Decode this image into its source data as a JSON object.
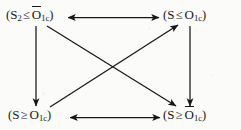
{
  "diagram": {
    "type": "commutative-square-diagram",
    "background_color": "#fbfbfa",
    "line_color": "#171717",
    "nodes": [
      {
        "id": "top-left",
        "position": "top-left",
        "text": "(S2 ≤ Ŏ1c)",
        "open_paren": "(",
        "variable": "S",
        "variable_subscript": "2",
        "relation": "≤",
        "operand": "O",
        "operand_overbar": true,
        "operand_subscript": "1c",
        "close_paren": ")"
      },
      {
        "id": "top-right",
        "position": "top-right",
        "text": "(S ≤ O1c)",
        "open_paren": "(",
        "variable": "S",
        "variable_subscript": "",
        "relation": "≤",
        "operand": "O",
        "operand_overbar": false,
        "operand_subscript": "1c",
        "close_paren": ")"
      },
      {
        "id": "bottom-left",
        "position": "bottom-left",
        "text": "(S ≥ O1c)",
        "open_paren": "(",
        "variable": "S",
        "variable_subscript": "",
        "relation": "≥",
        "operand": "O",
        "operand_overbar": false,
        "operand_subscript": "1c",
        "close_paren": ")"
      },
      {
        "id": "bottom-right",
        "position": "bottom-right",
        "text": "(S ≥ Ŏ1c)",
        "open_paren": "(",
        "variable": "S",
        "variable_subscript": "",
        "relation": "≥",
        "operand": "O",
        "operand_overbar": true,
        "operand_subscript": "1c",
        "close_paren": ")"
      }
    ],
    "edges": [
      {
        "id": "top-horizontal",
        "from": "top-left",
        "to": "top-right",
        "arrowheads": "both",
        "style": "solid"
      },
      {
        "id": "bottom-horizontal",
        "from": "bottom-left",
        "to": "bottom-right",
        "arrowheads": "both",
        "style": "solid"
      },
      {
        "id": "left-vertical",
        "from": "top-left",
        "to": "bottom-left",
        "arrowheads": "end",
        "style": "solid"
      },
      {
        "id": "right-vertical",
        "from": "top-right",
        "to": "bottom-right",
        "arrowheads": "end",
        "style": "solid"
      },
      {
        "id": "diagonal-tl-br",
        "from": "top-left",
        "to": "bottom-right",
        "arrowheads": "end",
        "style": "solid"
      },
      {
        "id": "diagonal-bl-tr",
        "from": "bottom-left",
        "to": "top-right",
        "arrowheads": "end",
        "style": "solid"
      }
    ]
  }
}
